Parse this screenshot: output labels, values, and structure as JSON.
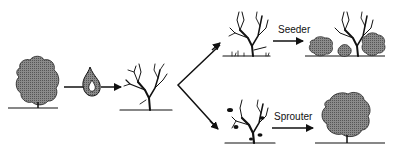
{
  "diagram": {
    "stages": [
      {
        "id": "mature-shrub",
        "description": "Mature shrub before fire"
      },
      {
        "id": "fire",
        "description": "Fire event"
      },
      {
        "id": "burned-skeleton",
        "description": "Burned shrub skeleton"
      },
      {
        "id": "seeder-post-fire",
        "description": "Dead skeleton with seedlings"
      },
      {
        "id": "seeder-recovered",
        "description": "Dead skeleton surrounded by new shrubs from seed"
      },
      {
        "id": "sprouter-post-fire",
        "description": "Burned shrub resprouting"
      },
      {
        "id": "sprouter-recovered",
        "description": "Shrub regrown from resprouts"
      }
    ],
    "labels": {
      "seeder": "Seeder",
      "sprouter": "Sprouter"
    },
    "colors": {
      "ink": "#111111",
      "foliage": "#7a7a7a",
      "flame_fill": "#9a9a9a"
    }
  }
}
